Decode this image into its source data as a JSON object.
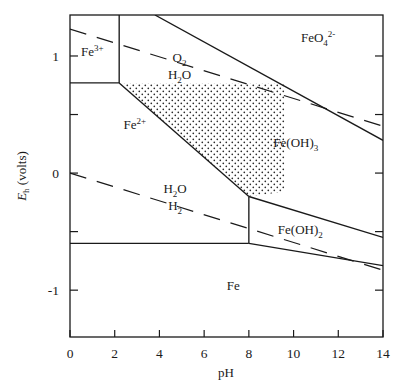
{
  "chart_data": {
    "type": "line",
    "title": "",
    "xlabel": "pH",
    "ylabel_main": "E",
    "ylabel_sub": "h",
    "ylabel_unit": " (volts)",
    "xlim": [
      0,
      14
    ],
    "ylim": [
      -1.4,
      1.35
    ],
    "grid": false,
    "legend": "none",
    "xticks": [
      0,
      2,
      4,
      6,
      8,
      10,
      12,
      14
    ],
    "xtick_labels": [
      "0",
      "2",
      "4",
      "6",
      "8",
      "10",
      "12",
      "14"
    ],
    "yticks": [
      1.0,
      0.5,
      0.0,
      -0.5,
      -1.0
    ],
    "ytick_labels": [
      "1",
      "",
      "0",
      "",
      "-1"
    ],
    "ylabeled_ticks": [
      {
        "value": 1.0,
        "label": "1"
      },
      {
        "value": 0.0,
        "label": "0"
      },
      {
        "value": -1.0,
        "label": "-1"
      }
    ],
    "stability_fields": [
      {
        "name": "Fe3+",
        "label_main": "Fe",
        "label_sup": "3+",
        "label_sub": "",
        "ph": 1.0,
        "eh": 1.0
      },
      {
        "name": "Fe2+",
        "label_main": "Fe",
        "label_sup": "2+",
        "label_sub": "",
        "ph": 2.9,
        "eh": 0.38
      },
      {
        "name": "Fe",
        "label_main": "Fe",
        "label_sup": "",
        "label_sub": "",
        "ph": 7.3,
        "eh": -1.0
      },
      {
        "name": "FeOH3",
        "label_main": "Fe(OH)",
        "label_sup": "",
        "label_sub": "3",
        "ph": 10.1,
        "eh": 0.22
      },
      {
        "name": "FeOH2",
        "label_main": "Fe(OH)",
        "label_sup": "",
        "label_sub": "2",
        "ph": 10.3,
        "eh": -0.52
      },
      {
        "name": "FeO4-2",
        "label_main": "FeO",
        "label_sup": "2-",
        "label_sub": "4",
        "ph": 11.1,
        "eh": 1.12
      }
    ],
    "water_stability_labels": [
      {
        "name": "O2-H2O",
        "numerator_main": "O",
        "numerator_sub": "2",
        "denominator_main": "H",
        "denominator_sub": "2",
        "denominator_tail": "O",
        "ph": 4.9,
        "eh": 0.95
      },
      {
        "name": "H2O-H2",
        "numerator_main": "H",
        "numerator_sub": "2",
        "numerator_tail": "O",
        "denominator_main": "H",
        "denominator_sub": "2",
        "ph": 4.7,
        "eh": -0.17
      }
    ],
    "solid_boundaries": [
      {
        "name": "fe3-fe2-vertical",
        "points": [
          [
            2.2,
            1.35
          ],
          [
            2.2,
            0.77
          ]
        ]
      },
      {
        "name": "fe3-feoh3-horizontal",
        "points": [
          [
            0.0,
            0.77
          ],
          [
            2.2,
            0.77
          ]
        ]
      },
      {
        "name": "fe2-feoh3-upper",
        "points": [
          [
            2.2,
            0.77
          ],
          [
            8.0,
            -0.2
          ]
        ]
      },
      {
        "name": "fe2-fe-horizontal",
        "points": [
          [
            0.0,
            -0.6
          ],
          [
            8.0,
            -0.6
          ]
        ]
      },
      {
        "name": "fe2-feoh2-vertical",
        "points": [
          [
            8.0,
            -0.2
          ],
          [
            8.0,
            -0.6
          ]
        ]
      },
      {
        "name": "feoh3-feoh2-boundary",
        "points": [
          [
            8.0,
            -0.2
          ],
          [
            14.0,
            -0.55
          ]
        ]
      },
      {
        "name": "feoh2-fe-boundary",
        "points": [
          [
            8.0,
            -0.6
          ],
          [
            14.0,
            -0.79
          ]
        ]
      },
      {
        "name": "feo4-upper-boundary",
        "points": [
          [
            3.8,
            1.35
          ],
          [
            14.0,
            0.28
          ]
        ]
      }
    ],
    "dashed_boundaries": [
      {
        "name": "o2-h2o-line",
        "points": [
          [
            0.0,
            1.23
          ],
          [
            14.0,
            0.4
          ]
        ]
      },
      {
        "name": "h2o-h2-line",
        "points": [
          [
            0.0,
            0.0
          ],
          [
            14.0,
            -0.83
          ]
        ]
      }
    ],
    "stippled_region": {
      "name": "Fe(OH)3-stippled-field",
      "points": [
        [
          2.2,
          0.77
        ],
        [
          9.6,
          0.77
        ],
        [
          9.6,
          -0.16
        ],
        [
          8.0,
          -0.2
        ]
      ],
      "pattern": "dotted-stipple"
    },
    "colors": {
      "line": "#1a1a1a",
      "background": "#ffffff",
      "text": "#1a1a1a",
      "stipple": "#2b2b2b"
    }
  },
  "axes": {
    "x_axis_label": "pH",
    "y_axis_label": "E_h (volts)"
  }
}
